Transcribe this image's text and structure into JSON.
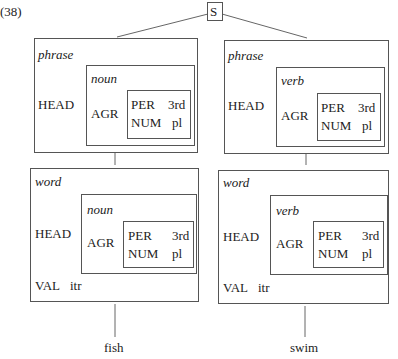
{
  "example_number": "(38)",
  "root": {
    "label": "S"
  },
  "left": {
    "phrase": {
      "type": "phrase",
      "head_label": "HEAD",
      "head_type": "noun",
      "agr_label": "AGR",
      "per_label": "PER",
      "per_value": "3rd",
      "num_label": "NUM",
      "num_value": "pl"
    },
    "word": {
      "type": "word",
      "head_label": "HEAD",
      "head_type": "noun",
      "agr_label": "AGR",
      "per_label": "PER",
      "per_value": "3rd",
      "num_label": "NUM",
      "num_value": "pl",
      "val_label": "VAL",
      "val_value": "itr"
    },
    "leaf": "fish"
  },
  "right": {
    "phrase": {
      "type": "phrase",
      "head_label": "HEAD",
      "head_type": "verb",
      "agr_label": "AGR",
      "per_label": "PER",
      "per_value": "3rd",
      "num_label": "NUM",
      "num_value": "pl"
    },
    "word": {
      "type": "word",
      "head_label": "HEAD",
      "head_type": "verb",
      "agr_label": "AGR",
      "per_label": "PER",
      "per_value": "3rd",
      "num_label": "NUM",
      "num_value": "pl",
      "val_label": "VAL",
      "val_value": "itr"
    },
    "leaf": "swim"
  }
}
